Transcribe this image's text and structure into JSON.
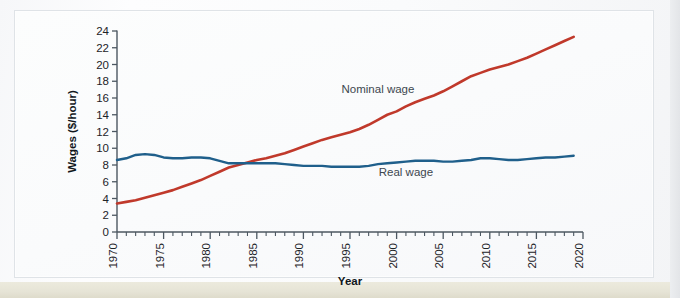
{
  "figure": {
    "background_color": "#fafbfc",
    "frame_color": "#dfe3e7"
  },
  "chart_data": {
    "type": "line",
    "title": "",
    "xlabel": "Year",
    "ylabel": "Wages ($/hour)",
    "xlim": [
      1970,
      2020
    ],
    "ylim": [
      0,
      24
    ],
    "ytick_step": 2,
    "xtick_step": 5,
    "xminor_step": 1,
    "grid": false,
    "legend_position": "inline-annotations",
    "ytick_labels": [
      "0",
      "2",
      "4",
      "6",
      "8",
      "10",
      "12",
      "14",
      "16",
      "18",
      "20",
      "22",
      "24"
    ],
    "xtick_labels": [
      "1970",
      "1975",
      "1980",
      "1985",
      "1990",
      "1995",
      "2000",
      "2005",
      "2010",
      "2015",
      "2020"
    ],
    "series": [
      {
        "name": "Nominal wage",
        "color": "#c0392b",
        "annotation": "Nominal wage",
        "annotation_x": 1998,
        "annotation_y": 16.6,
        "x": [
          1970,
          1971,
          1972,
          1973,
          1974,
          1975,
          1976,
          1977,
          1978,
          1979,
          1980,
          1981,
          1982,
          1983,
          1984,
          1985,
          1986,
          1987,
          1988,
          1989,
          1990,
          1991,
          1992,
          1993,
          1994,
          1995,
          1996,
          1997,
          1998,
          1999,
          2000,
          2001,
          2002,
          2003,
          2004,
          2005,
          2006,
          2007,
          2008,
          2009,
          2010,
          2011,
          2012,
          2013,
          2014,
          2015,
          2016,
          2017,
          2018,
          2019
        ],
        "values": [
          3.4,
          3.6,
          3.8,
          4.1,
          4.4,
          4.7,
          5.0,
          5.4,
          5.8,
          6.2,
          6.7,
          7.2,
          7.7,
          8.0,
          8.3,
          8.6,
          8.8,
          9.1,
          9.4,
          9.8,
          10.2,
          10.6,
          11.0,
          11.3,
          11.6,
          11.9,
          12.3,
          12.8,
          13.4,
          14.0,
          14.4,
          15.0,
          15.5,
          15.9,
          16.3,
          16.8,
          17.4,
          18.0,
          18.6,
          19.0,
          19.4,
          19.7,
          20.0,
          20.4,
          20.8,
          21.3,
          21.8,
          22.3,
          22.8,
          23.3
        ]
      },
      {
        "name": "Real wage",
        "color": "#1f5f8b",
        "annotation": "Real wage",
        "annotation_x": 2001,
        "annotation_y": 6.7,
        "x": [
          1970,
          1971,
          1972,
          1973,
          1974,
          1975,
          1976,
          1977,
          1978,
          1979,
          1980,
          1981,
          1982,
          1983,
          1984,
          1985,
          1986,
          1987,
          1988,
          1989,
          1990,
          1991,
          1992,
          1993,
          1994,
          1995,
          1996,
          1997,
          1998,
          1999,
          2000,
          2001,
          2002,
          2003,
          2004,
          2005,
          2006,
          2007,
          2008,
          2009,
          2010,
          2011,
          2012,
          2013,
          2014,
          2015,
          2016,
          2017,
          2018,
          2019
        ],
        "values": [
          8.6,
          8.8,
          9.2,
          9.3,
          9.2,
          8.9,
          8.8,
          8.8,
          8.9,
          8.9,
          8.8,
          8.5,
          8.2,
          8.2,
          8.2,
          8.2,
          8.2,
          8.2,
          8.1,
          8.0,
          7.9,
          7.9,
          7.9,
          7.8,
          7.8,
          7.8,
          7.8,
          7.9,
          8.1,
          8.2,
          8.3,
          8.4,
          8.5,
          8.5,
          8.5,
          8.4,
          8.4,
          8.5,
          8.6,
          8.8,
          8.8,
          8.7,
          8.6,
          8.6,
          8.7,
          8.8,
          8.9,
          8.9,
          9.0,
          9.1
        ]
      }
    ]
  }
}
